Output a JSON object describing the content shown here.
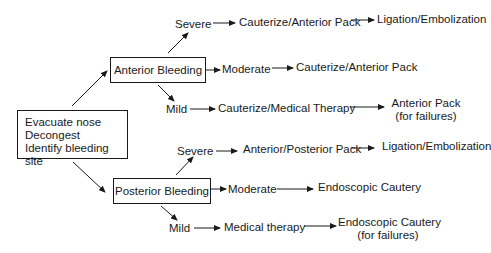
{
  "start": {
    "lines": [
      "Evacuate nose",
      "Decongest",
      "Identify bleeding site"
    ]
  },
  "anterior": {
    "label": "Anterior Bleeding",
    "severe": {
      "label": "Severe",
      "step1": "Cauterize/Anterior Pack",
      "step2": "Ligation/Embolization"
    },
    "moderate": {
      "label": "Moderate",
      "step1": "Cauterize/Anterior Pack"
    },
    "mild": {
      "label": "Mild",
      "step1": "Cauterize/Medical Therapy",
      "step2": "Anterior Pack",
      "step2_note": "(for failures)"
    }
  },
  "posterior": {
    "label": "Posterior Bleeding",
    "severe": {
      "label": "Severe",
      "step1": "Anterior/Posterior Pack",
      "step2": "Ligation/Embolization"
    },
    "moderate": {
      "label": "Moderate",
      "step1": "Endoscopic Cautery"
    },
    "mild": {
      "label": "Mild",
      "step1": "Medical therapy",
      "step2": "Endoscopic Cautery",
      "step2_note": "(for failures)"
    }
  },
  "colors": {
    "line": "#1a1a1a",
    "background": "#ffffff"
  }
}
